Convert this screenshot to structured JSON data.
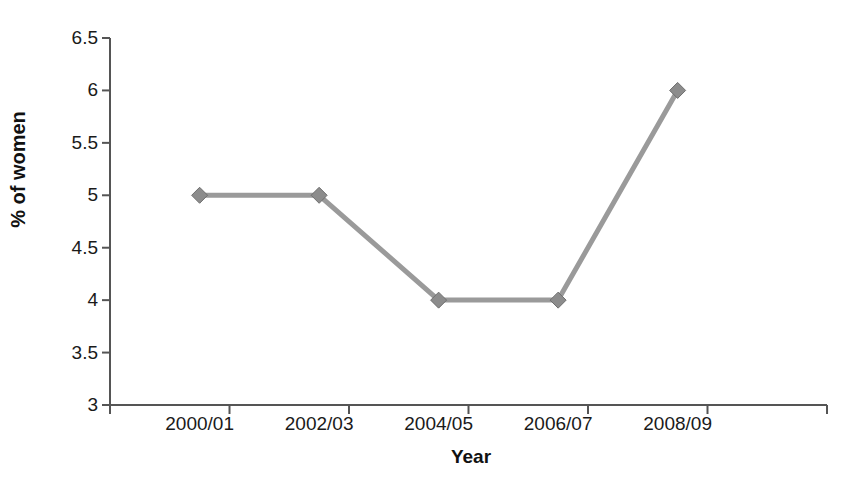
{
  "chart_data": {
    "type": "line",
    "title": "",
    "subtitle": "",
    "xlabel": "Year",
    "ylabel": "% of women",
    "categories": [
      "2000/01",
      "2002/03",
      "2004/05",
      "2006/07",
      "2008/09"
    ],
    "series": [
      {
        "name": "% of women",
        "values": [
          5,
          5,
          4,
          4,
          6
        ],
        "color": "#9a9a9a",
        "marker": "diamond"
      }
    ],
    "ylim": [
      3,
      6.5
    ],
    "ytick_labels": [
      "3",
      "3.5",
      "4",
      "4.5",
      "5",
      "5.5",
      "6",
      "6.5"
    ],
    "ytick_values": [
      3,
      3.5,
      4,
      4.5,
      5,
      5.5,
      6,
      6.5
    ],
    "grid": false,
    "legend": false,
    "legend_position": "none",
    "axis_color": "#555555",
    "line_color": "#9a9a9a",
    "marker_color": "#8c8c8c",
    "background": "#ffffff"
  }
}
